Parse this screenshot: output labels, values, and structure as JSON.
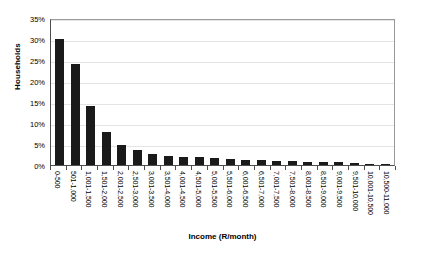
{
  "chart_data": {
    "type": "bar",
    "title": "",
    "xlabel": "Income (R/month)",
    "ylabel": "Households",
    "ylim": [
      0,
      35
    ],
    "ytick_labels": [
      "0%",
      "5%",
      "10%",
      "15%",
      "20%",
      "25%",
      "30%",
      "35%"
    ],
    "ytick_values": [
      0,
      5,
      10,
      15,
      20,
      25,
      30,
      35
    ],
    "grid": true,
    "legend": "none",
    "bar_color": "#1a1a1a",
    "categories": [
      "0-500",
      "501-1,000",
      "1,001-1,500",
      "1,501-2,000",
      "2,001-2,500",
      "2,501-3,000",
      "3,001-3,500",
      "3,501-4,000",
      "4,001-4,500",
      "4,501-5,000",
      "5,001-5,500",
      "5,501-6,000",
      "6,001-6,500",
      "6,501-7,000",
      "7,001-7,500",
      "7,501-8,000",
      "8,001-8,500",
      "8,501-9,000",
      "9,001-9,500",
      "9,501-10,000",
      "10,001-10,500",
      "10,500-11,000"
    ],
    "values": [
      30,
      24,
      14,
      7.8,
      4.7,
      3.6,
      2.6,
      2.1,
      1.9,
      1.8,
      1.7,
      1.5,
      1.3,
      1.1,
      1.0,
      0.9,
      0.8,
      0.7,
      0.6,
      0.4,
      0.3,
      0.2
    ]
  }
}
